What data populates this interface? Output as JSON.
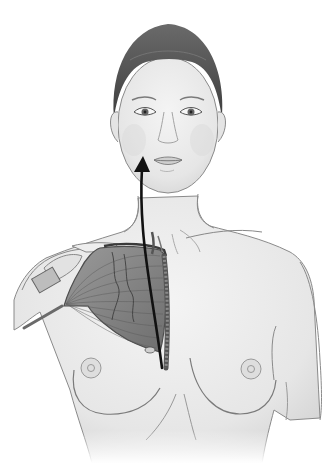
{
  "figure": {
    "colors": {
      "background": "#ffffff",
      "skin": "#ebebeb",
      "skin_shadow": "#d4d4d4",
      "outline": "#8a8a8a",
      "hair": "#5e5e5e",
      "muscle": "#8c8c8c",
      "muscle_dark": "#4e4e4e",
      "arrow": "#111111"
    },
    "annotations": {
      "arrow": {
        "from": [
          162,
          368
        ],
        "to": [
          140,
          160
        ],
        "meaning": "flap transposition path"
      }
    }
  }
}
